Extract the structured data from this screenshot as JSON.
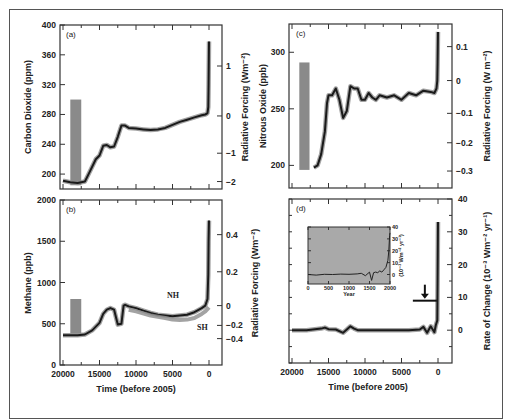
{
  "chart_data": [
    {
      "panel": "(a)",
      "type": "line",
      "xlabel": "",
      "ylabel": "Carbon Dioxide (ppm)",
      "ylabel_right": "Radiative Forcing (Wm⁻²)",
      "x_ticks": [
        20000,
        15000,
        10000,
        5000,
        0
      ],
      "ylim": [
        180,
        400
      ],
      "y_ticks": [
        200,
        240,
        280,
        320,
        360,
        400
      ],
      "y_right_ticks": [
        {
          "label": "1",
          "value": 345
        },
        {
          "label": "0",
          "value": 278
        },
        {
          "label": "−1",
          "value": 228
        },
        {
          "label": "−2",
          "value": 190
        }
      ],
      "grey_bar": {
        "x_from": 19000,
        "x_to": 17500,
        "y_from": 185,
        "y_to": 300
      },
      "series": [
        {
          "name": "CO2",
          "x": [
            20000,
            19000,
            18000,
            17000,
            16500,
            15500,
            15000,
            14500,
            14000,
            13500,
            13000,
            12500,
            12000,
            11500,
            11000,
            10000,
            9000,
            8000,
            7000,
            6000,
            5000,
            4000,
            3000,
            2000,
            1000,
            500,
            300,
            200,
            100,
            50,
            0
          ],
          "y": [
            191,
            189,
            188,
            190,
            200,
            220,
            225,
            238,
            239,
            236,
            237,
            250,
            265,
            265,
            262,
            261,
            260,
            259,
            260,
            262,
            266,
            270,
            273,
            276,
            279,
            280,
            281,
            282,
            290,
            320,
            378
          ]
        }
      ]
    },
    {
      "panel": "(b)",
      "type": "line",
      "xlabel": "Time (before 2005)",
      "ylabel": "Methane (ppb)",
      "ylabel_right": "Radiative Forcing (Wm⁻²)",
      "x_ticks": [
        20000,
        15000,
        10000,
        5000,
        0
      ],
      "ylim": [
        0,
        2000
      ],
      "y_ticks": [
        0,
        500,
        1000,
        1500,
        2000
      ],
      "y_right_ticks": [
        {
          "label": "0.4",
          "value": 1580
        },
        {
          "label": "0.2",
          "value": 1130
        },
        {
          "label": "0",
          "value": 720
        },
        {
          "label": "−0.2",
          "value": 480
        },
        {
          "label": "−0.4",
          "value": 320
        }
      ],
      "grey_bar": {
        "x_from": 19000,
        "x_to": 17500,
        "y_from": 380,
        "y_to": 800
      },
      "annotations": [
        "NH",
        "SH"
      ],
      "series": [
        {
          "name": "NH",
          "x": [
            20000,
            18000,
            17000,
            16000,
            15000,
            14500,
            14000,
            13500,
            13000,
            12500,
            12000,
            11700,
            11500,
            11000,
            10000,
            9000,
            8000,
            7000,
            6000,
            5000,
            4000,
            3000,
            2000,
            1000,
            500,
            200,
            100,
            50,
            0
          ],
          "y": [
            360,
            360,
            370,
            420,
            510,
            620,
            670,
            690,
            670,
            490,
            500,
            720,
            730,
            710,
            690,
            660,
            630,
            610,
            600,
            590,
            600,
            610,
            640,
            690,
            720,
            800,
            1100,
            1500,
            1750
          ]
        },
        {
          "name": "SH",
          "x": [
            11000,
            10000,
            8000,
            6000,
            5000,
            4000,
            3000,
            2000,
            1000,
            500,
            0
          ],
          "y": [
            670,
            650,
            600,
            570,
            550,
            545,
            550,
            570,
            620,
            650,
            700
          ]
        }
      ]
    },
    {
      "panel": "(c)",
      "type": "line",
      "xlabel": "",
      "ylabel": "Nitrous Oxide (ppb)",
      "ylabel_right": "Radiative Forcing (W m⁻²)",
      "x_ticks": [
        20000,
        15000,
        10000,
        5000,
        0
      ],
      "ylim": [
        180,
        325
      ],
      "y_ticks": [
        200,
        250,
        300
      ],
      "y_right_ticks": [
        {
          "label": "0.1",
          "value": 305
        },
        {
          "label": "0",
          "value": 275
        },
        {
          "label": "−0.1",
          "value": 246
        },
        {
          "label": "−0.2",
          "value": 220
        },
        {
          "label": "−0.3",
          "value": 195
        }
      ],
      "grey_bar": {
        "x_from": 19000,
        "x_to": 17600,
        "y_from": 196,
        "y_to": 291
      },
      "series": [
        {
          "name": "N2O",
          "x": [
            17000,
            16500,
            16000,
            15500,
            15200,
            15000,
            14500,
            14000,
            13500,
            13000,
            12500,
            12000,
            11500,
            11000,
            10500,
            10000,
            9500,
            9000,
            8500,
            8000,
            7000,
            6000,
            5000,
            4000,
            3000,
            2000,
            1000,
            500,
            200,
            100,
            50,
            0
          ],
          "y": [
            198,
            200,
            210,
            230,
            255,
            262,
            262,
            268,
            258,
            242,
            248,
            270,
            268,
            268,
            258,
            258,
            264,
            260,
            258,
            262,
            260,
            262,
            258,
            264,
            262,
            266,
            265,
            264,
            268,
            275,
            290,
            318
          ]
        }
      ]
    },
    {
      "panel": "(d)",
      "type": "line",
      "xlabel": "Time (before 2005)",
      "ylabel": "Radiative Forcing (Wm⁻²)",
      "ylabel_right": "Rate of Change (10⁻³ Wm⁻² yr⁻¹)",
      "x_ticks": [
        20000,
        15000,
        10000,
        5000,
        0
      ],
      "ylim": [
        -10,
        40
      ],
      "y_ticks": [
        0,
        10,
        20,
        30,
        40
      ],
      "arrow_at": {
        "x": 1800,
        "y": 9
      },
      "series": [
        {
          "name": "Rate of Change",
          "x": [
            20000,
            18000,
            16000,
            15500,
            15000,
            14000,
            13000,
            12500,
            12000,
            11500,
            11000,
            10000,
            8000,
            6000,
            4000,
            2500,
            2000,
            1500,
            1000,
            500,
            300,
            100,
            50,
            0
          ],
          "y": [
            0,
            0,
            0.5,
            0.8,
            0.3,
            0.2,
            -0.8,
            0.2,
            1.2,
            0.5,
            0,
            0,
            0,
            0,
            0,
            0.2,
            1.0,
            -0.8,
            1.2,
            -0.6,
            1.5,
            3,
            15,
            33
          ]
        }
      ],
      "inset": {
        "xlabel": "Year",
        "ylabel": "(10⁻³ Wm⁻² yr⁻¹)",
        "x_ticks": [
          0,
          500,
          1000,
          1500,
          2000
        ],
        "y_ticks": [
          0,
          10,
          20,
          30,
          40
        ],
        "ylim": [
          -8,
          40
        ],
        "background": "#a9a9a9",
        "series": [
          {
            "name": "Rate of Change (last 2000 yr)",
            "x": [
              0,
              200,
              400,
              600,
              800,
              1000,
              1200,
              1300,
              1400,
              1500,
              1550,
              1600,
              1650,
              1700,
              1750,
              1800,
              1850,
              1900,
              1950,
              1970,
              1990,
              2000
            ],
            "y": [
              0,
              -0.5,
              0.2,
              0,
              0.3,
              0.2,
              0.5,
              1,
              -1,
              2,
              -5,
              1.5,
              2,
              1.5,
              3,
              2,
              4,
              6,
              12,
              20,
              33,
              35
            ]
          }
        ]
      }
    }
  ],
  "labels": {
    "a": "(a)",
    "b": "(b)",
    "c": "(c)",
    "d": "(d)",
    "time_label": "Time (before 2005)",
    "co2_ylabel": "Carbon Dioxide (ppm)",
    "rf_ylabel": "Radiative Forcing (Wm⁻²)",
    "rf_ylabel_c": "Radiative Forcing (W m⁻²)",
    "ch4_ylabel": "Methane (ppb)",
    "n2o_ylabel": "Nitrous Oxide (ppb)",
    "rate_ylabel": "Rate of Change (10⁻³ Wm⁻² yr⁻¹)",
    "nh": "NH",
    "sh": "SH",
    "inset_xlabel": "Year",
    "inset_ylabel": "(10⁻³ Wm⁻² yr⁻¹)"
  },
  "colors": {
    "line": "#1a1a1a",
    "band": "#8c8c8c",
    "bar": "#8a8a8a",
    "inset_bg": "#a9a9a9",
    "frame": "#333333"
  }
}
